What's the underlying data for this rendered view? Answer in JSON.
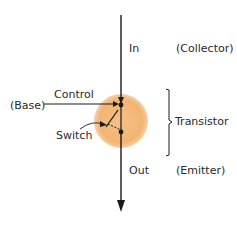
{
  "diagram": {
    "labels": {
      "in": "In",
      "collector": "(Collector)",
      "control": "Control",
      "base": "(Base)",
      "transistor": "Transistor",
      "switch": "Switch",
      "out": "Out",
      "emitter": "(Emitter)"
    },
    "colors": {
      "circle_fill": "#f3b879",
      "line": "#1a1a1a",
      "text": "#2a2a2a"
    }
  }
}
